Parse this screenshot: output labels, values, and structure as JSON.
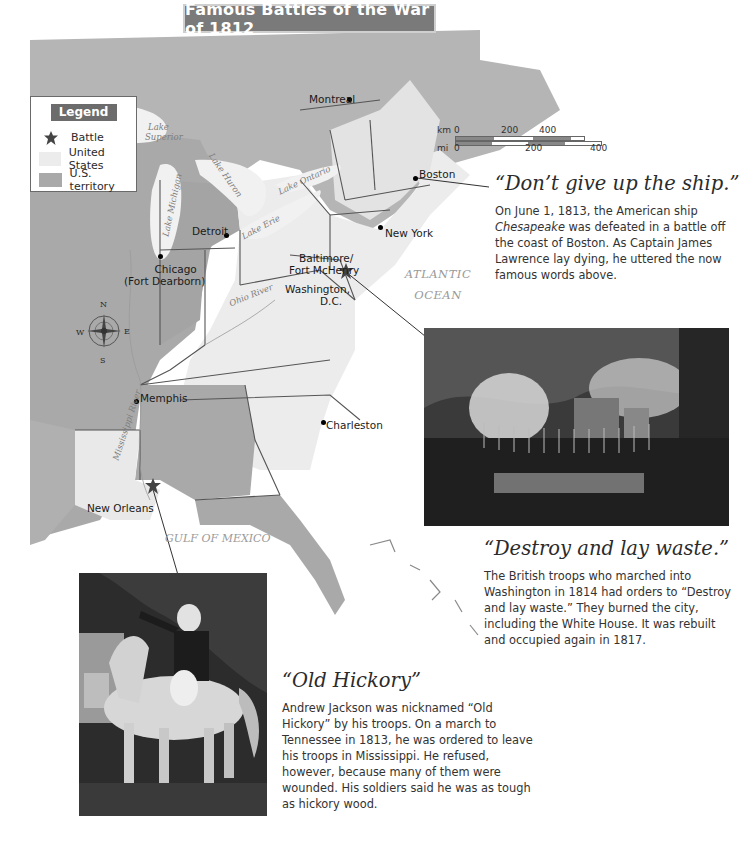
{
  "title": "Famous Battles of the War of 1812",
  "legend": {
    "title": "Legend",
    "items": [
      {
        "label": "Battle",
        "symbol": "battle-starburst-icon"
      },
      {
        "label": "United States",
        "color": "#ececec"
      },
      {
        "label": "U.S. territory",
        "color": "#a9a9a9"
      }
    ]
  },
  "scale": {
    "km_label": "km",
    "mi_label": "mi",
    "km_ticks": [
      "0",
      "200",
      "400"
    ],
    "mi_ticks": [
      "0",
      "200",
      "400"
    ]
  },
  "compass": {
    "n": "N",
    "s": "S",
    "e": "E",
    "w": "W"
  },
  "cities": {
    "montreal": "Montreal",
    "boston": "Boston",
    "new_york": "New York",
    "detroit": "Detroit",
    "chicago": "Chicago",
    "chicago_alt": "(Fort Dearborn)",
    "baltimore": "Baltimore/",
    "fort_mchenry": "Fort McHenry",
    "washington": "Washington,",
    "dc": "D.C.",
    "memphis": "Memphis",
    "charleston": "Charleston",
    "new_orleans": "New Orleans"
  },
  "water": {
    "atlantic_line1": "ATLANTIC",
    "atlantic_line2": "OCEAN",
    "gulf": "GULF OF MEXICO",
    "lake_superior_1": "Lake",
    "lake_superior_2": "Superior",
    "lake_michigan": "Lake Michigan",
    "lake_huron": "Lake Huron",
    "lake_erie": "Lake Erie",
    "lake_ontario": "Lake Ontario",
    "ohio_river": "Ohio River",
    "mississippi_river": "Mississippi River"
  },
  "callouts": [
    {
      "title": "“Don’t give up the ship.”",
      "body_pre": "On June 1, 1813, the American ship ",
      "body_italic": "Chesapeake",
      "body_post": " was defeated in a battle off the coast of Boston. As Captain James Lawrence lay dying, he uttered the now famous words above."
    },
    {
      "title": "“Destroy and lay waste.”",
      "body": "The British troops who marched into Washington in 1814 had orders to “Destroy and lay waste.” They burned the city, including the White House. It was rebuilt and occupied again in 1817.",
      "image": "burning-of-washington-engraving"
    },
    {
      "title": "“Old Hickory”",
      "body": "Andrew Jackson was nicknamed “Old Hickory” by his troops. On a march to Tennessee in 1813, he was ordered to leave his troops in Mississippi. He refused, however, because many of them were wounded. His soldiers said he was as tough as hickory wood.",
      "image": "andrew-jackson-on-horseback-portrait"
    }
  ],
  "colors": {
    "us_state": "#ececec",
    "us_territory": "#a9a9a9",
    "foreign_land": "#b8b8b8",
    "water": "#f4f4f4",
    "title_banner": "#7a7a7a"
  }
}
